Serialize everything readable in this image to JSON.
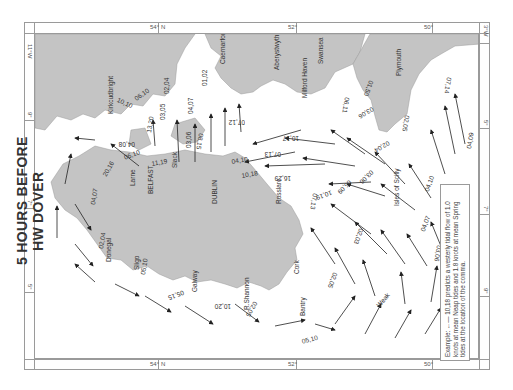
{
  "title": {
    "line1": "5 HOURS BEFORE",
    "line2": "HW DOVER"
  },
  "frame": {
    "top_labels": [
      "54°",
      "N",
      "52°",
      "50°"
    ],
    "left_labels": [
      "11°W",
      "9°",
      "7°",
      "5°"
    ],
    "right_labels": [
      "3°W",
      "5°",
      "7°",
      "9°"
    ],
    "bottom_labels": [
      "54°",
      "N",
      "52°",
      "50°"
    ]
  },
  "legend": {
    "example_label": "Example:",
    "example_rate": "10,18",
    "text": "predicts a westerly tidal flow of 1.0 knots at mean Neap tides and 1.8 knots at mean Spring tides at the location of the comma."
  },
  "places": {
    "kirkcudbright": "Kirkcudbright",
    "caernarfon": "Caernarfon",
    "aberystwyth": "Aberystwyth",
    "swansea": "Swansea",
    "milford_haven": "Milford Haven",
    "plymouth": "Plymouth",
    "larne": "Larne",
    "belfast": "BELFAST",
    "dublin": "DUBLIN",
    "rosslare": "Rosslare",
    "donegal": "Donegal",
    "sligo": "Sligo",
    "galway": "Galway",
    "shannon": "R.Shannon",
    "cork": "Cork",
    "bantry": "Bantry",
    "scilly": "Isles of Scilly",
    "slack": "Slack",
    "weak": "Weak"
  },
  "tidal_rates": [
    "10,10",
    "06,10",
    "13,20",
    "02,04",
    "03,05",
    "04,07",
    "01,02",
    "03,06",
    "08,15",
    "07,12",
    "04,10",
    "10,17",
    "07,13",
    "10,18",
    "16,29",
    "10,19",
    "06,11",
    "01,50",
    "02,05",
    "07,14",
    "03,06",
    "02,04",
    "03,06",
    "04,09",
    "04,10",
    "04,07",
    "03,06",
    "05,09",
    "02,03",
    "07,13",
    "02,05",
    "05,10",
    "02,05",
    "10,20",
    "05,15",
    "05,10",
    "02,04",
    "04,07",
    "20,16",
    "04,08",
    "11,19",
    "06,10"
  ],
  "colors": {
    "land": "#c4c4c4",
    "sea": "#ffffff",
    "border": "#9a9a9a",
    "text": "#333333",
    "arrow": "#222222"
  }
}
